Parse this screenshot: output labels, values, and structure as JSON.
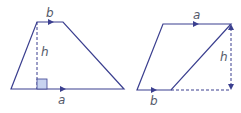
{
  "colors": {
    "line": "#3b3f8f",
    "dashed": "#3b3f8f",
    "right_angle_fill": "#c7d3f0",
    "label": "#555a6a"
  },
  "trapezoid": {
    "labels": {
      "top": "b",
      "height": "h",
      "bottom": "a"
    }
  },
  "parallelogram": {
    "labels": {
      "top": "a",
      "height": "h",
      "bottom": "b"
    }
  }
}
